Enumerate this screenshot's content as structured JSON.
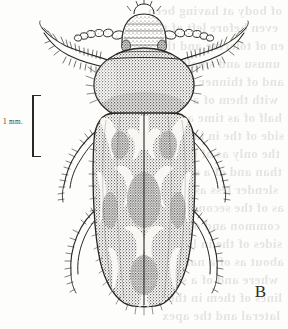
{
  "figure": {
    "letter": "B",
    "scale_bar": {
      "label": "1 mm.",
      "orientation": "vertical",
      "length_px": 62
    },
    "colors": {
      "paper": "#fdfdfb",
      "ink": "#2a2722",
      "stipple_dark": "#3a362f",
      "pale_marking": "#f6f5f1",
      "bleed_text": "#6d6a63"
    }
  },
  "anatomy": {
    "parts": [
      {
        "name": "head",
        "label": "head"
      },
      {
        "name": "antenna-left",
        "label": "left antenna"
      },
      {
        "name": "antenna-right",
        "label": "right antenna"
      },
      {
        "name": "pronotum",
        "label": "pronotum"
      },
      {
        "name": "scutellum",
        "label": "scutellum"
      },
      {
        "name": "elytron-left",
        "label": "left elytron"
      },
      {
        "name": "elytron-right",
        "label": "right elytron"
      },
      {
        "name": "foreleg-left",
        "label": "left foreleg"
      },
      {
        "name": "foreleg-right",
        "label": "right foreleg"
      },
      {
        "name": "midleg-left",
        "label": "left midleg"
      },
      {
        "name": "midleg-right",
        "label": "right midleg"
      },
      {
        "name": "hindleg-left",
        "label": "left hindleg"
      },
      {
        "name": "hindleg-right",
        "label": "right hindleg"
      }
    ]
  },
  "bleed_through": {
    "note": "faint mirrored text showing through from reverse of page; illegible",
    "lines": [
      {
        "text": "of  body  at  having  been",
        "x": 6,
        "y": 3,
        "size": 13
      },
      {
        "text": "even  before  left  of  the",
        "x": 10,
        "y": 20,
        "size": 13
      },
      {
        "text": "en  of  tolerate  and  the",
        "x": 4,
        "y": 38,
        "size": 13
      },
      {
        "text": "unusu  and  small  of  a",
        "x": 8,
        "y": 56,
        "size": 13
      },
      {
        "text": "and  of  thinner  stems",
        "x": 4,
        "y": 74,
        "size": 13
      },
      {
        "text": "with  them  of  a  nearly",
        "x": 10,
        "y": 92,
        "size": 13
      },
      {
        "text": "half  of  as  time  a  bit",
        "x": 6,
        "y": 110,
        "size": 13
      },
      {
        "text": "side  of  the  in  larger",
        "x": 4,
        "y": 128,
        "size": 13
      },
      {
        "text": "the  only  as  of  brown",
        "x": 8,
        "y": 146,
        "size": 13
      },
      {
        "text": "than  and  of  a  single",
        "x": 6,
        "y": 164,
        "size": 13
      },
      {
        "text": "slender  less  as  parts",
        "x": 10,
        "y": 182,
        "size": 13
      },
      {
        "text": "as  of  the  second  one",
        "x": 4,
        "y": 200,
        "size": 13
      },
      {
        "text": "common  and  of  small",
        "x": 8,
        "y": 218,
        "size": 13
      },
      {
        "text": "sides  of  the  in  long",
        "x": 6,
        "y": 236,
        "size": 13
      },
      {
        "text": "about  as  of  a  narrow",
        "x": 4,
        "y": 254,
        "size": 13
      },
      {
        "text": "where  and  of  a  short",
        "x": 10,
        "y": 272,
        "size": 13
      },
      {
        "text": "lines  of  them  in  the",
        "x": 6,
        "y": 290,
        "size": 13
      },
      {
        "text": "lateral  and  the  apex",
        "x": 8,
        "y": 308,
        "size": 13
      }
    ]
  }
}
